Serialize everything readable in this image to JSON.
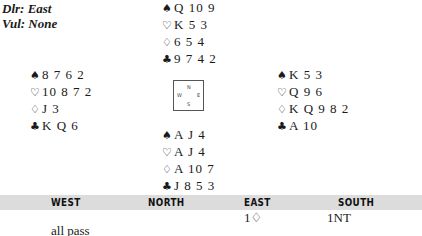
{
  "meta": {
    "dealer": "Dlr: East",
    "vulnerability": "Vul: None"
  },
  "suits": {
    "spades": "♠",
    "hearts": "♡",
    "diamonds": "♢",
    "clubs": "♣"
  },
  "hands": {
    "north": {
      "spades": "Q 10 9",
      "hearts": "K 5 3",
      "diamonds": "6 5 4",
      "clubs": "9 7 4 2"
    },
    "west": {
      "spades": "8 7 6 2",
      "hearts": "10 8 7 2",
      "diamonds": "J 3",
      "clubs": "K Q 6"
    },
    "east": {
      "spades": "K 5 3",
      "hearts": "Q 9 6",
      "diamonds": "K Q 9 8 2",
      "clubs": "A 10"
    },
    "south": {
      "spades": "A J 4",
      "hearts": "A J 4",
      "diamonds": "A 10 7",
      "clubs": "J 8 5 3"
    }
  },
  "compass": {
    "n": "N",
    "s": "S",
    "w": "W",
    "e": "E"
  },
  "auction": {
    "headers": [
      "WEST",
      "NORTH",
      "EAST",
      "SOUTH"
    ],
    "rows": [
      [
        "",
        "",
        "1♢",
        "1NT"
      ],
      [
        "all pass",
        "",
        "",
        ""
      ]
    ]
  },
  "colors": {
    "header_bar": "#dcdcdc",
    "text": "#1a1a1a"
  }
}
